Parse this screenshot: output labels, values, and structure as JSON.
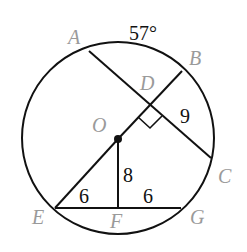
{
  "diagram": {
    "type": "circle-geometry",
    "arc_label": "57°",
    "points": {
      "A": "A",
      "B": "B",
      "C": "C",
      "D": "D",
      "O": "O",
      "E": "E",
      "F": "F",
      "G": "G"
    },
    "measures": {
      "DC": "9",
      "OF": "8",
      "EF": "6",
      "FG": "6"
    },
    "colors": {
      "stroke": "#111111",
      "point_label": "#9a9a9a",
      "number_label": "#111111"
    }
  }
}
